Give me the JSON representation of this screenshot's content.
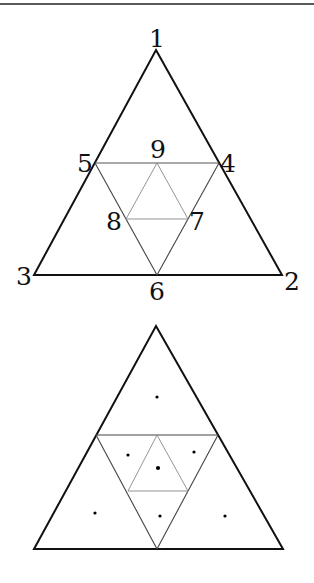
{
  "colors": {
    "outline": "#111111",
    "inner_dark": "#444444",
    "inner_light": "#888888",
    "dot": "#000000"
  },
  "figure_top": {
    "vertices": {
      "1": {
        "label": "1",
        "x": 156,
        "y": 50
      },
      "2": {
        "label": "2",
        "x": 282,
        "y": 275
      },
      "3": {
        "label": "3",
        "x": 34,
        "y": 275
      },
      "4": {
        "label": "4",
        "x": 219,
        "y": 163
      },
      "5": {
        "label": "5",
        "x": 95,
        "y": 163
      },
      "6": {
        "label": "6",
        "x": 157,
        "y": 275
      },
      "7": {
        "label": "7",
        "x": 188,
        "y": 219
      },
      "8": {
        "label": "8",
        "x": 126,
        "y": 219
      },
      "9": {
        "label": "9",
        "x": 157,
        "y": 163
      }
    }
  },
  "figure_bottom": {
    "apex": {
      "x": 156,
      "y": 326
    },
    "base_left": {
      "x": 34,
      "y": 549
    },
    "base_right": {
      "x": 283,
      "y": 549
    },
    "dots": [
      {
        "x": 157,
        "y": 397
      },
      {
        "x": 128,
        "y": 455
      },
      {
        "x": 194,
        "y": 452
      },
      {
        "x": 158,
        "y": 468
      },
      {
        "x": 95,
        "y": 513
      },
      {
        "x": 160,
        "y": 516
      },
      {
        "x": 225,
        "y": 516
      }
    ]
  }
}
